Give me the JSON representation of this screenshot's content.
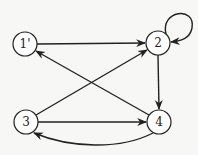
{
  "diagram": {
    "type": "directed-graph",
    "nodes": [
      {
        "id": "1",
        "label": "1'",
        "x": 25,
        "y": 44
      },
      {
        "id": "2",
        "label": "2",
        "x": 158,
        "y": 43
      },
      {
        "id": "3",
        "label": "3",
        "x": 26,
        "y": 122
      },
      {
        "id": "4",
        "label": "4",
        "x": 159,
        "y": 122
      }
    ],
    "edges": [
      {
        "from": "1",
        "to": "2"
      },
      {
        "from": "2",
        "to": "2",
        "style": "self-loop"
      },
      {
        "from": "2",
        "to": "4"
      },
      {
        "from": "3",
        "to": "2"
      },
      {
        "from": "3",
        "to": "4"
      },
      {
        "from": "4",
        "to": "1"
      },
      {
        "from": "4",
        "to": "3",
        "style": "curved"
      }
    ],
    "colors": {
      "stroke": "#222222",
      "node_fill": "#ffffff",
      "background": "#f7f7f5"
    }
  }
}
